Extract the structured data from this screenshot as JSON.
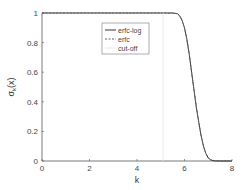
{
  "chart_data": {
    "type": "line",
    "title": "",
    "xlabel": "k",
    "ylabel": "σ_k(x)",
    "xlim": [
      0,
      8
    ],
    "ylim": [
      0,
      1
    ],
    "xticks": [
      0,
      2,
      4,
      6,
      8
    ],
    "yticks": [
      0,
      0.2,
      0.4,
      0.6,
      0.8,
      1
    ],
    "xtick_labels": [
      "0",
      "2",
      "4",
      "6",
      "8"
    ],
    "ytick_labels": [
      "0",
      "0.2",
      "0.4",
      "0.6",
      "0.8",
      "1"
    ],
    "grid": false,
    "legend_position": "upper center",
    "series": [
      {
        "name": "erfc-log",
        "style": "solid",
        "color": "#333333",
        "x": [
          0,
          1,
          2,
          3,
          4,
          5,
          5.5,
          5.7,
          5.8,
          5.9,
          6.0,
          6.1,
          6.2,
          6.3,
          6.4,
          6.5,
          6.6,
          6.7,
          6.8,
          6.9,
          7.0,
          7.1,
          7.2,
          7.3,
          7.5,
          8
        ],
        "y": [
          1,
          1,
          1,
          1,
          1,
          1,
          1,
          0.995,
          0.98,
          0.95,
          0.9,
          0.82,
          0.72,
          0.6,
          0.48,
          0.36,
          0.26,
          0.17,
          0.1,
          0.05,
          0.02,
          0.008,
          0.003,
          0.001,
          0,
          0
        ]
      },
      {
        "name": "erfc",
        "style": "dashed",
        "color": "#666666",
        "x": [
          0,
          1,
          2,
          3,
          4,
          5,
          5.5,
          5.7,
          5.8,
          5.9,
          6.0,
          6.1,
          6.2,
          6.3,
          6.4,
          6.5,
          6.6,
          6.7,
          6.8,
          6.9,
          7.0,
          7.1,
          7.2,
          7.3,
          7.5,
          8
        ],
        "y": [
          1,
          1,
          1,
          1,
          1,
          1,
          1,
          0.995,
          0.98,
          0.95,
          0.9,
          0.82,
          0.72,
          0.6,
          0.48,
          0.36,
          0.26,
          0.17,
          0.1,
          0.05,
          0.02,
          0.008,
          0.003,
          0.001,
          0,
          0
        ]
      },
      {
        "name": "cut-off",
        "style": "solid",
        "color": "#e6e6e6",
        "x": [
          5.1,
          5.1
        ],
        "y": [
          0,
          1
        ]
      }
    ]
  }
}
